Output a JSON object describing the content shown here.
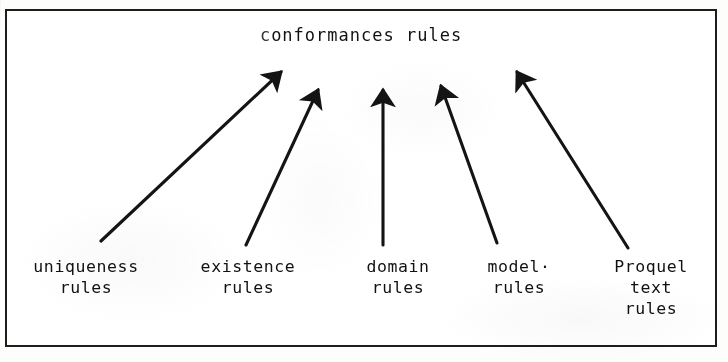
{
  "figure": {
    "title": "conformances rules",
    "frame_color": "#1d1d1d",
    "ink_color": "#111111",
    "background_color": "#fdfdfc"
  },
  "nodes": [
    {
      "id": "uniqueness",
      "label": "uniqueness\nrules"
    },
    {
      "id": "existence",
      "label": "existence\nrules"
    },
    {
      "id": "domain",
      "label": "domain\nrules"
    },
    {
      "id": "model",
      "label": "model·\nrules"
    },
    {
      "id": "proquel",
      "label": "Proquel\ntext\nrules"
    }
  ],
  "arrows": [
    {
      "id": "arrow-uniqueness",
      "from": "uniqueness",
      "to": "title",
      "x1": 101,
      "y1": 241,
      "x2": 281,
      "y2": 70
    },
    {
      "id": "arrow-existence",
      "from": "existence",
      "to": "title",
      "x1": 246,
      "y1": 245,
      "x2": 318,
      "y2": 88
    },
    {
      "id": "arrow-domain",
      "from": "domain",
      "to": "title",
      "x1": 383,
      "y1": 245,
      "x2": 383,
      "y2": 88
    },
    {
      "id": "arrow-model",
      "from": "model",
      "to": "title",
      "x1": 497,
      "y1": 243,
      "x2": 440,
      "y2": 84
    },
    {
      "id": "arrow-proquel",
      "from": "proquel",
      "to": "title",
      "x1": 628,
      "y1": 248,
      "x2": 516,
      "y2": 70
    }
  ]
}
